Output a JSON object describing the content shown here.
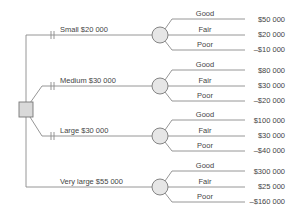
{
  "diagram": {
    "type": "decision-tree",
    "decision_node": {
      "shape": "square",
      "fill": "#d9d9d9"
    },
    "chance_node": {
      "shape": "circle",
      "fill": "#e6e6e6"
    },
    "line_color": "#8a8a8a",
    "branches": [
      {
        "label": "Small $20 000",
        "blocked_marker": true,
        "outcomes": [
          {
            "label": "Good",
            "value": "$50 000"
          },
          {
            "label": "Fair",
            "value": "$20 000"
          },
          {
            "label": "Poor",
            "value": "–$10 000"
          }
        ]
      },
      {
        "label": "Medium $30 000",
        "blocked_marker": true,
        "outcomes": [
          {
            "label": "Good",
            "value": "$80 000"
          },
          {
            "label": "Fair",
            "value": "$30 000"
          },
          {
            "label": "Poor",
            "value": "–$20 000"
          }
        ]
      },
      {
        "label": "Large $30 000",
        "blocked_marker": true,
        "outcomes": [
          {
            "label": "Good",
            "value": "$100 000"
          },
          {
            "label": "Fair",
            "value": "$30 000"
          },
          {
            "label": "Poor",
            "value": "–$40 000"
          }
        ]
      },
      {
        "label": "Very large $55 000",
        "blocked_marker": false,
        "outcomes": [
          {
            "label": "Good",
            "value": "$300 000"
          },
          {
            "label": "Fair",
            "value": "$25 000"
          },
          {
            "label": "Poor",
            "value": "–$160 000"
          }
        ]
      }
    ]
  }
}
